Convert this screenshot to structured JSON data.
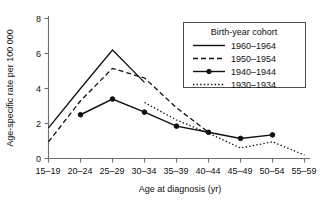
{
  "chart_data": {
    "type": "line",
    "title": "",
    "xlabel": "Age at diagnosis (yr)",
    "ylabel": "Age-specific rate per 100 000",
    "categories": [
      "15–19",
      "20–24",
      "25–29",
      "30–34",
      "35–39",
      "40–44",
      "45–49",
      "50–54",
      "55–59"
    ],
    "ylim": [
      0,
      8
    ],
    "yticks": [
      0,
      2,
      4,
      6,
      8
    ],
    "ytick_labels": [
      "0",
      "2",
      "4",
      "6",
      "8"
    ],
    "grid": false,
    "legend_position": "upper-right",
    "legend_title": "Birth-year cohort",
    "series": [
      {
        "name": "1960–1964",
        "style": "solid",
        "markers": false,
        "x": [
          "15–19",
          "20–24",
          "25–29",
          "30–34"
        ],
        "values": [
          1.75,
          4.0,
          6.2,
          4.35
        ]
      },
      {
        "name": "1950–1954",
        "style": "dashed",
        "markers": false,
        "x": [
          "15–19",
          "20–24",
          "25–29",
          "30–34",
          "35–39",
          "40–44"
        ],
        "values": [
          0.95,
          3.3,
          5.15,
          4.6,
          2.9,
          1.5
        ]
      },
      {
        "name": "1940–1944",
        "style": "solid-marker",
        "markers": true,
        "x": [
          "20–24",
          "25–29",
          "30–34",
          "35–39",
          "40–44",
          "45–49",
          "50–54"
        ],
        "values": [
          2.5,
          3.4,
          2.65,
          1.85,
          1.5,
          1.15,
          1.35
        ]
      },
      {
        "name": "1930–1934",
        "style": "dotted",
        "markers": false,
        "x": [
          "30–34",
          "35–39",
          "40–44",
          "45–49",
          "50–54",
          "55–59"
        ],
        "values": [
          3.2,
          2.2,
          1.45,
          0.6,
          0.95,
          0.2
        ]
      }
    ]
  },
  "colors": {
    "line": "#111111",
    "axis": "#6e6e6e",
    "legend_border": "#4d4d4d",
    "background": "#ffffff"
  }
}
